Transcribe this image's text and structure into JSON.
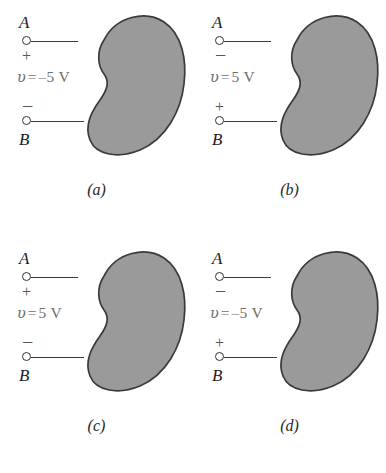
{
  "figure": {
    "background_color": "#ffffff",
    "blob_fill_color": "#9a9a9a",
    "blob_stroke_color": "#3a3a3a",
    "text_color": "#1d1d1d",
    "label_color": "#6d6d6d"
  },
  "panels": [
    {
      "id": "a",
      "caption": "(a)",
      "caption_open": "(",
      "caption_letter": "a",
      "caption_close": ")",
      "top_node_label": "A",
      "bottom_node_label": "B",
      "top_sign": "+",
      "bottom_sign": "−",
      "voltage_symbol": "υ",
      "voltage_equals": "=",
      "voltage_value": "–5 V",
      "voltage_text": "υ = –5 V",
      "element_shape": "kidney-blob"
    },
    {
      "id": "b",
      "caption": "(b)",
      "caption_open": "(",
      "caption_letter": "b",
      "caption_close": ")",
      "top_node_label": "A",
      "bottom_node_label": "B",
      "top_sign": "−",
      "bottom_sign": "+",
      "voltage_symbol": "υ",
      "voltage_equals": "=",
      "voltage_value": "5 V",
      "voltage_text": "υ = 5 V",
      "element_shape": "kidney-blob"
    },
    {
      "id": "c",
      "caption": "(c)",
      "caption_open": "(",
      "caption_letter": "c",
      "caption_close": ")",
      "top_node_label": "A",
      "bottom_node_label": "B",
      "top_sign": "+",
      "bottom_sign": "−",
      "voltage_symbol": "υ",
      "voltage_equals": "=",
      "voltage_value": "5 V",
      "voltage_text": "υ = 5 V",
      "element_shape": "kidney-blob"
    },
    {
      "id": "d",
      "caption": "(d)",
      "caption_open": "(",
      "caption_letter": "d",
      "caption_close": ")",
      "top_node_label": "A",
      "bottom_node_label": "B",
      "top_sign": "−",
      "bottom_sign": "+",
      "voltage_symbol": "υ",
      "voltage_equals": "=",
      "voltage_value": "–5 V",
      "voltage_text": "υ = –5 V",
      "element_shape": "kidney-blob"
    }
  ]
}
